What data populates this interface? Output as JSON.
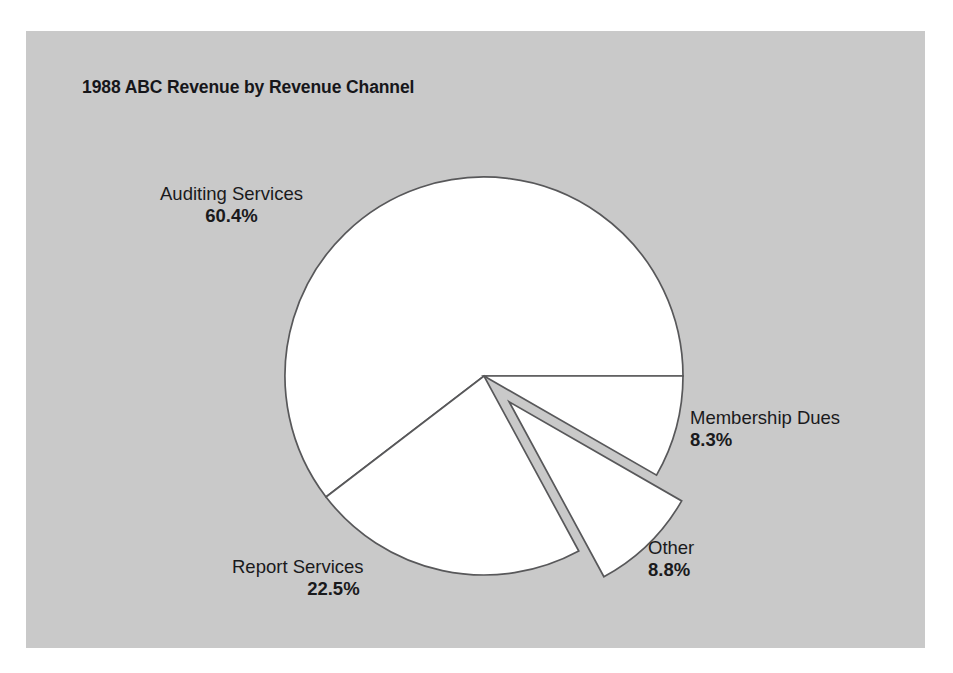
{
  "chart_data": {
    "type": "pie",
    "title": "1988 ABC Revenue by Revenue Channel",
    "xlabel": "",
    "ylabel": "",
    "legend_position": "none",
    "grid": false,
    "units": "percent",
    "total": 100.0,
    "categories": [
      "Auditing Services",
      "Report Services",
      "Other",
      "Membership Dues"
    ],
    "values": [
      60.4,
      22.5,
      8.8,
      8.3
    ],
    "labels": [
      "60.4%",
      "22.5%",
      "8.8%",
      "8.3%"
    ],
    "slices": [
      {
        "name": "Auditing Services",
        "value": 60.4,
        "label": "60.4%",
        "exploded": false,
        "fill": "#ffffff",
        "stroke": "#58585a"
      },
      {
        "name": "Report Services",
        "value": 22.5,
        "label": "22.5%",
        "exploded": false,
        "fill": "#ffffff",
        "stroke": "#58585a"
      },
      {
        "name": "Other",
        "value": 8.8,
        "label": "8.8%",
        "exploded": true,
        "fill": "#ffffff",
        "stroke": "#58585a"
      },
      {
        "name": "Membership Dues",
        "value": 8.3,
        "label": "8.3%",
        "exploded": false,
        "fill": "#ffffff",
        "stroke": "#58585a"
      }
    ],
    "start_angle_deg": 0,
    "direction": "counterclockwise"
  },
  "figure": {
    "panel_background": "#c9c9c9",
    "page_background": "#ffffff",
    "slice_fill": "#ffffff",
    "slice_stroke": "#58585a",
    "text_color": "#1a1a1c"
  },
  "labels": {
    "auditing": {
      "name": "Auditing Services",
      "value": "60.4%"
    },
    "report": {
      "name": "Report Services",
      "value": "22.5%"
    },
    "other": {
      "name": "Other",
      "value": "8.8%"
    },
    "membership": {
      "name": "Membership Dues",
      "value": "8.3%"
    }
  }
}
